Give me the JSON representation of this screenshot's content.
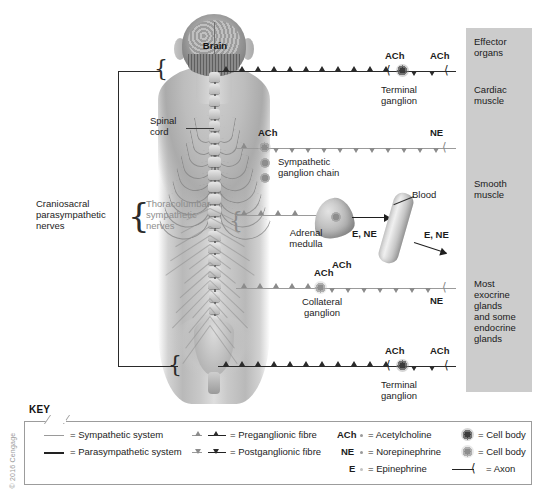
{
  "figure": {
    "anatomy_labels": [
      {
        "id": "brain",
        "text": "Brain"
      },
      {
        "id": "spinal-cord",
        "text": "Spinal\ncord"
      }
    ]
  },
  "left_labels": {
    "parasympathetic": "Craniosacral\nparasympathetic\nnerves",
    "sympathetic": "Thoracolumbar\nsympathetic\nnerves"
  },
  "pathways": [
    {
      "id": "cranial-parasympathetic",
      "system": "parasympathetic",
      "neurotransmitters": [
        "ACh",
        "ACh"
      ],
      "ganglion": "Terminal\nganglion"
    },
    {
      "id": "sympathetic-chain",
      "system": "sympathetic",
      "neurotransmitters": [
        "ACh",
        "NE"
      ],
      "ganglion": "Sympathetic\nganglion chain"
    },
    {
      "id": "adrenal-medulla",
      "system": "sympathetic",
      "neurotransmitters": [
        "ACh"
      ],
      "organ": "Adrenal\nmedulla",
      "blood": "Blood",
      "hormones_to_blood": "E, NE",
      "hormones_to_target": "E, NE"
    },
    {
      "id": "collateral-ganglion",
      "system": "sympathetic",
      "neurotransmitters": [
        "ACh",
        "NE"
      ],
      "ganglion": "Collateral\nganglion"
    },
    {
      "id": "sacral-parasympathetic",
      "system": "parasympathetic",
      "neurotransmitters": [
        "ACh",
        "ACh"
      ],
      "ganglion": "Terminal\nganglion"
    }
  ],
  "effector_column": {
    "background_color": "#cccccc",
    "items": [
      {
        "id": "effector-organs",
        "text": "Effector\norgans"
      },
      {
        "id": "cardiac-muscle",
        "text": "Cardiac\nmuscle"
      },
      {
        "id": "smooth-muscle",
        "text": "Smooth\nmuscle"
      },
      {
        "id": "exocrine-endocrine-glands",
        "text": "Most\nexocrine\nglands\nand some\nendocrine\nglands"
      }
    ]
  },
  "key": {
    "title": "KEY",
    "column1": [
      {
        "id": "sympathetic-system",
        "symbol": "gray-line",
        "text": "= Sympathetic system",
        "color": "#9a9a9a"
      },
      {
        "id": "parasympathetic-system",
        "symbol": "black-line",
        "text": "= Parasympathetic system",
        "color": "#222222"
      }
    ],
    "column2": [
      {
        "id": "preganglionic-fibre",
        "symbol": "up-triangle",
        "text": "= Preganglionic fibre"
      },
      {
        "id": "postganglionic-fibre",
        "symbol": "down-triangle",
        "text": "= Postganglionic fibre"
      }
    ],
    "column3": [
      {
        "id": "ach",
        "abbr": "ACh",
        "text": "= Acetylcholine"
      },
      {
        "id": "ne",
        "abbr": "NE",
        "text": "= Norepinephrine"
      },
      {
        "id": "e",
        "abbr": "E",
        "text": "= Epinephrine"
      }
    ],
    "column4": [
      {
        "id": "cell-body-dark",
        "symbol": "dark-starburst",
        "text": "= Cell body"
      },
      {
        "id": "cell-body-light",
        "symbol": "light-starburst",
        "text": "= Cell body"
      },
      {
        "id": "axon",
        "symbol": "axon-terminal",
        "text": "= Axon"
      }
    ]
  },
  "copyright": "© 2016 Cengage"
}
